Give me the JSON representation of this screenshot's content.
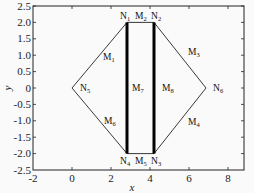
{
  "diagram": {
    "type": "mesh-region-plot",
    "xlabel": "x",
    "ylabel": "y",
    "xlim": [
      -2,
      9
    ],
    "ylim": [
      -2.5,
      2.5
    ],
    "xticks": [
      "-2",
      "0",
      "2",
      "4",
      "6",
      "8"
    ],
    "yticks": [
      "2.5",
      "2.0",
      "1.5",
      "1.0",
      "0.5",
      "0",
      "-0.5",
      "-1.0",
      "-1.5",
      "-2.0",
      "-2.5"
    ],
    "nodes": [
      {
        "id": "N1",
        "x": 2.8,
        "y": 2.0
      },
      {
        "id": "N2",
        "x": 4.2,
        "y": 2.0
      },
      {
        "id": "N3",
        "x": 4.2,
        "y": -2.0
      },
      {
        "id": "N4",
        "x": 2.8,
        "y": -2.0
      },
      {
        "id": "N5",
        "x": 0.0,
        "y": 0.0
      },
      {
        "id": "N6",
        "x": 6.9,
        "y": 0.0
      }
    ],
    "edges": [
      {
        "id": "M1",
        "from": "N5",
        "to": "N1",
        "bold": false
      },
      {
        "id": "M2",
        "from": "N1",
        "to": "N2",
        "bold": false
      },
      {
        "id": "M3",
        "from": "N2",
        "to": "N6",
        "bold": false
      },
      {
        "id": "M4",
        "from": "N6",
        "to": "N3",
        "bold": false
      },
      {
        "id": "M5",
        "from": "N3",
        "to": "N4",
        "bold": false
      },
      {
        "id": "M6",
        "from": "N4",
        "to": "N5",
        "bold": false
      },
      {
        "id": "M7",
        "from": "N1",
        "to": "N4",
        "bold": true
      },
      {
        "id": "M8",
        "from": "N2",
        "to": "N3",
        "bold": true
      }
    ],
    "labels": {
      "N1": "N",
      "N1_sub": "1",
      "N2": "N",
      "N2_sub": "2",
      "N3": "N",
      "N3_sub": "3",
      "N4": "N",
      "N4_sub": "4",
      "N5": "N",
      "N5_sub": "5",
      "N6": "N",
      "N6_sub": "6",
      "M1": "M",
      "M1_sub": "1",
      "M2": "M",
      "M2_sub": "2",
      "M3": "M",
      "M3_sub": "3",
      "M4": "M",
      "M4_sub": "4",
      "M5": "M",
      "M5_sub": "5",
      "M6": "M",
      "M6_sub": "6",
      "M7": "M",
      "M7_sub": "7",
      "M8": "M",
      "M8_sub": "8"
    }
  }
}
